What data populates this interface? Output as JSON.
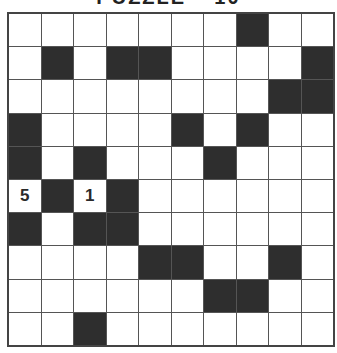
{
  "title": "PUZZLE – 10",
  "grid": {
    "rows": 10,
    "cols": 10,
    "colors": {
      "black": "#2e2e2e",
      "white": "#ffffff"
    },
    "black_cells": [
      [
        0,
        7
      ],
      [
        1,
        1
      ],
      [
        1,
        3
      ],
      [
        1,
        4
      ],
      [
        1,
        9
      ],
      [
        2,
        8
      ],
      [
        2,
        9
      ],
      [
        3,
        0
      ],
      [
        3,
        5
      ],
      [
        3,
        7
      ],
      [
        4,
        0
      ],
      [
        4,
        2
      ],
      [
        4,
        6
      ],
      [
        5,
        1
      ],
      [
        5,
        3
      ],
      [
        6,
        0
      ],
      [
        6,
        2
      ],
      [
        6,
        3
      ],
      [
        7,
        4
      ],
      [
        7,
        5
      ],
      [
        7,
        8
      ],
      [
        8,
        6
      ],
      [
        8,
        7
      ],
      [
        9,
        2
      ]
    ],
    "numbered_cells": [
      {
        "row": 5,
        "col": 0,
        "value": "5"
      },
      {
        "row": 5,
        "col": 2,
        "value": "1"
      }
    ]
  }
}
